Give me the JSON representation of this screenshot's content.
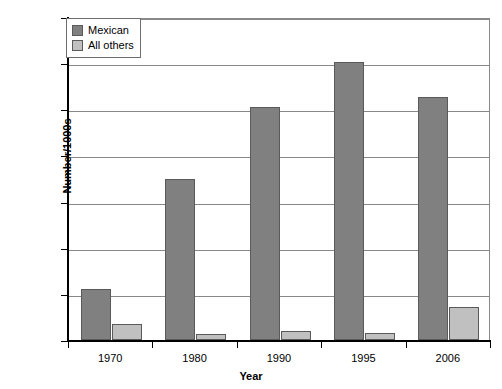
{
  "chart_data": {
    "type": "bar",
    "title": "",
    "xlabel": "Year",
    "ylabel": "Number/1000s",
    "categories": [
      "1970",
      "1980",
      "1990",
      "1995",
      "2006"
    ],
    "series": [
      {
        "name": "Mexican",
        "color": "#808080",
        "values": [
          220,
          700,
          1010,
          1205,
          1055
        ]
      },
      {
        "name": "All others",
        "color": "#c0c0c0",
        "values": [
          70,
          25,
          40,
          30,
          145
        ]
      }
    ],
    "ylim": [
      0,
      1400
    ],
    "yticks": [
      0,
      200,
      400,
      600,
      800,
      1000,
      1200,
      1400
    ],
    "ytick_labels": [
      "0",
      "200",
      "400",
      "600",
      "800",
      "1000",
      "1200",
      "1400"
    ],
    "grid": true,
    "legend_position": "top-left-inside"
  }
}
